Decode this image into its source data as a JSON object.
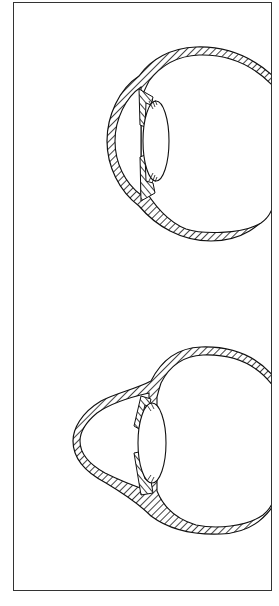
{
  "figure": {
    "panels": [
      {
        "name": "normal-eye",
        "label": "",
        "cornea": "normal curvature"
      },
      {
        "name": "cone-shaped-cornea-eye",
        "label": "",
        "cornea": "conical protrusion"
      }
    ],
    "colors": {
      "line": "#111111",
      "frame": "#333333",
      "background": "#ffffff"
    }
  },
  "caption": {
    "text": ""
  }
}
